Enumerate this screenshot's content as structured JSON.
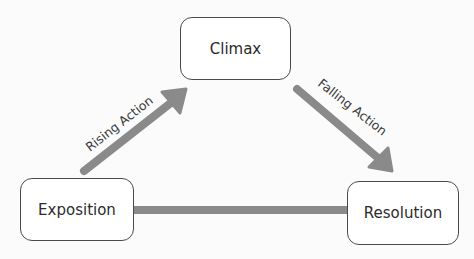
{
  "diagram": {
    "nodes": {
      "climax": "Climax",
      "exposition": "Exposition",
      "resolution": "Resolution"
    },
    "edges": {
      "rising": "Rising Action",
      "falling": "Falling Action"
    },
    "colors": {
      "arrow": "#8a8a8a",
      "box_border": "#4a4a4a",
      "text": "#2b2b2b"
    }
  }
}
